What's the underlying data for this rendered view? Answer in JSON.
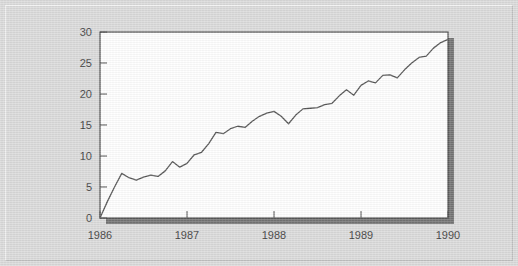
{
  "figure": {
    "background_color": "#d9d9d9",
    "plot_background_color": "#ffffff",
    "frame_color": "#3a3a3a",
    "shadow_color": "#6a6a6a",
    "line_color": "#4a4a4a"
  },
  "chart_data": {
    "type": "line",
    "title": "",
    "subtitle": "",
    "xlabel": "",
    "ylabel": "",
    "xlim": [
      1986,
      1990
    ],
    "ylim": [
      0,
      30
    ],
    "grid": false,
    "legend": null,
    "legend_position": "none",
    "x_tick_labels": [
      "1986",
      "1987",
      "1988",
      "1989",
      "1990"
    ],
    "x_tick_values": [
      1986,
      1987,
      1988,
      1989,
      1990
    ],
    "y_tick_labels": [
      "0",
      "5",
      "10",
      "15",
      "20",
      "25",
      "30"
    ],
    "y_tick_values": [
      0,
      5,
      10,
      15,
      20,
      25,
      30
    ],
    "series": [
      {
        "name": "series-1",
        "color": "#4a4a4a",
        "x": [
          1986.0,
          1986.083,
          1986.167,
          1986.25,
          1986.333,
          1986.417,
          1986.5,
          1986.583,
          1986.667,
          1986.75,
          1986.833,
          1986.917,
          1987.0,
          1987.083,
          1987.167,
          1987.25,
          1987.333,
          1987.417,
          1987.5,
          1987.583,
          1987.667,
          1987.75,
          1987.833,
          1987.917,
          1988.0,
          1988.083,
          1988.167,
          1988.25,
          1988.333,
          1988.417,
          1988.5,
          1988.583,
          1988.667,
          1988.75,
          1988.833,
          1988.917,
          1989.0,
          1989.083,
          1989.167,
          1989.25,
          1989.333,
          1989.417,
          1989.5,
          1989.583,
          1989.667,
          1989.75,
          1989.833,
          1989.917,
          1990.0
        ],
        "y": [
          0.0,
          2.6,
          5.0,
          7.2,
          6.5,
          6.1,
          6.6,
          6.9,
          6.7,
          7.6,
          9.1,
          8.2,
          8.8,
          10.2,
          10.6,
          12.0,
          13.8,
          13.6,
          14.4,
          14.8,
          14.6,
          15.6,
          16.4,
          16.9,
          17.2,
          16.4,
          15.2,
          16.6,
          17.6,
          17.7,
          17.8,
          18.3,
          18.5,
          19.7,
          20.7,
          19.8,
          21.4,
          22.1,
          21.8,
          23.0,
          23.1,
          22.6,
          23.9,
          25.0,
          25.9,
          26.1,
          27.4,
          28.3,
          28.8
        ]
      }
    ],
    "annotations": [
      {
        "label": "start",
        "x": 1986.0,
        "y": 0.0
      },
      {
        "label": "peak",
        "x": 1989.833,
        "y": 28.8
      },
      {
        "label": "end",
        "x": 1990.0,
        "y": 28.2
      }
    ]
  }
}
